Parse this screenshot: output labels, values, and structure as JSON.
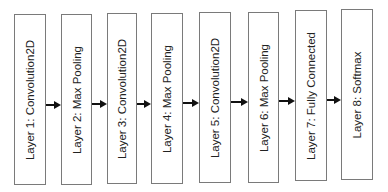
{
  "diagram": {
    "type": "flowchart",
    "direction": "left-to-right",
    "layers": [
      {
        "label": "Layer 1: Convolution2D"
      },
      {
        "label": "Layer 2: Max Pooling"
      },
      {
        "label": "Layer 3: Convolution2D"
      },
      {
        "label": "Layer 4: Max Pooling"
      },
      {
        "label": "Layer 5: Convolution2D"
      },
      {
        "label": "Layer 6: Max Pooling"
      },
      {
        "label": "Layer 7: Fully Connected"
      },
      {
        "label": "Layer 8: Softmax"
      }
    ],
    "edges": [
      {
        "from": 1,
        "to": 2
      },
      {
        "from": 2,
        "to": 3
      },
      {
        "from": 3,
        "to": 4
      },
      {
        "from": 4,
        "to": 5
      },
      {
        "from": 5,
        "to": 6
      },
      {
        "from": 6,
        "to": 7
      },
      {
        "from": 7,
        "to": 8
      }
    ],
    "colors": {
      "border": "#7a7a7a",
      "arrow": "#111111",
      "text": "#222222"
    }
  }
}
